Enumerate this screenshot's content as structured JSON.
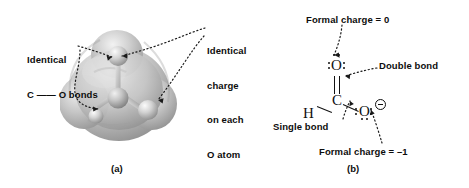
{
  "figure": {
    "panel_a": {
      "caption": "(a)",
      "labels": [
        {
          "id": "identical-co-bonds",
          "line1": "Identical",
          "line2": "C —— O bonds"
        },
        {
          "id": "identical-charge",
          "line1": "Identical",
          "line2": "charge",
          "line3": "on each",
          "line4": "O atom"
        }
      ],
      "model": {
        "type": "electrostatic-potential-surface",
        "molecule": "formate ion",
        "atoms": [
          {
            "symbol": "C",
            "role": "central"
          },
          {
            "symbol": "O",
            "role": "upper"
          },
          {
            "symbol": "O",
            "role": "lower-right"
          },
          {
            "symbol": "H",
            "role": "lower-left"
          }
        ],
        "surface_color": "#b9b9b9",
        "highlight_color": "#e8e8e8",
        "shadow_color": "#8a8a8a"
      }
    },
    "panel_b": {
      "caption": "(b)",
      "labels": [
        {
          "id": "formal-charge-zero",
          "text": "Formal charge = 0"
        },
        {
          "id": "double-bond",
          "text": "Double bond"
        },
        {
          "id": "single-bond",
          "text": "Single bond"
        },
        {
          "id": "formal-charge-minus-one",
          "text": "Formal charge = –1"
        }
      ],
      "lewis": {
        "molecule": "formate ion",
        "atoms": [
          {
            "symbol": "O",
            "position": "top",
            "lone_pairs": 2,
            "charge": "0"
          },
          {
            "symbol": "C",
            "position": "center",
            "lone_pairs": 0,
            "charge": ""
          },
          {
            "symbol": "H",
            "position": "left",
            "lone_pairs": 0,
            "charge": ""
          },
          {
            "symbol": "O",
            "position": "right",
            "lone_pairs": 3,
            "charge": "−"
          }
        ],
        "bonds": [
          {
            "from": "C",
            "to": "O-top",
            "order": 2,
            "name": "Double bond"
          },
          {
            "from": "C",
            "to": "O-right",
            "order": 1,
            "name": "Single bond"
          },
          {
            "from": "C",
            "to": "H",
            "order": 1,
            "name": "C–H bond"
          }
        ],
        "charge_symbol": "−"
      }
    },
    "colors": {
      "text": "#0d0d0d",
      "ink": "#111111",
      "background": "#ffffff",
      "leader": "#1a1a1a"
    }
  }
}
